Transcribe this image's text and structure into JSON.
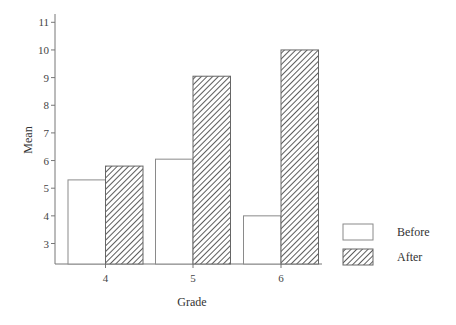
{
  "chart_data": {
    "type": "bar",
    "title": "",
    "xlabel": "Grade",
    "ylabel": "Mean",
    "categories": [
      "4",
      "5",
      "6"
    ],
    "series": [
      {
        "name": "Before",
        "values": [
          5.3,
          6.05,
          4.0
        ],
        "style": "white-fill"
      },
      {
        "name": "After",
        "values": [
          5.8,
          9.05,
          10.0
        ],
        "style": "diagonal-hatch"
      }
    ],
    "yticks": [
      3,
      4,
      5,
      6,
      7,
      8,
      9,
      10,
      11
    ],
    "ylim": [
      2.25,
      11
    ],
    "grid": false,
    "legend_position": "right-bottom"
  },
  "colors": {
    "axis": "#777777",
    "before_stroke": "#8a8a8a",
    "hatch": "#333333",
    "text": "#333333"
  }
}
